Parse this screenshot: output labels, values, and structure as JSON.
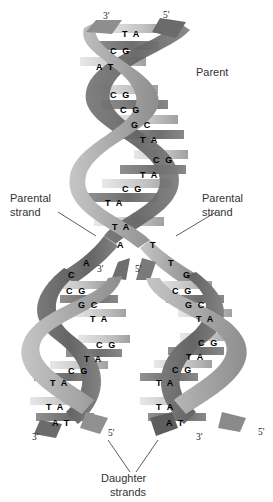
{
  "figure": {
    "background": "#ffffff",
    "ribbon_colors": {
      "light": "#b9b9b9",
      "mid": "#9a9a9a",
      "dark": "#6f6f6f",
      "darker": "#585858",
      "rung_light": "#d6d6d6",
      "rung_dark": "#7d7d7d",
      "rung_white": "#f4f4f4"
    }
  },
  "callouts": {
    "parent": "Parent",
    "parental_strand_left_line1": "Parental",
    "parental_strand_left_line2": "strand",
    "parental_strand_right_line1": "Parental",
    "parental_strand_right_line2": "strand",
    "daughter_line1": "Daughter",
    "daughter_line2": "strands"
  },
  "end_labels": {
    "parent_top_left": "3'",
    "parent_top_right": "5'",
    "fork_left": "3'",
    "fork_right": "5'",
    "daughter_left_left": "3'",
    "daughter_left_right": "5'",
    "daughter_right_left": "3'",
    "daughter_right_right": "5'"
  },
  "base_pairs": {
    "parent": [
      {
        "text": "T A",
        "x": 122,
        "y": 29
      },
      {
        "text": "C G",
        "x": 110,
        "y": 46
      },
      {
        "text": "A T",
        "x": 96,
        "y": 62
      },
      {
        "text": "C G",
        "x": 110,
        "y": 90
      },
      {
        "text": "C G",
        "x": 120,
        "y": 105
      },
      {
        "text": "G C",
        "x": 131,
        "y": 120
      },
      {
        "text": "T A",
        "x": 140,
        "y": 135
      },
      {
        "text": "C G",
        "x": 153,
        "y": 155
      },
      {
        "text": "T A",
        "x": 140,
        "y": 170
      },
      {
        "text": "C G",
        "x": 122,
        "y": 184
      },
      {
        "text": "T A",
        "x": 105,
        "y": 198
      },
      {
        "text": "T A",
        "x": 112,
        "y": 222
      }
    ],
    "fork_unpaired_left": [
      {
        "text": "A",
        "x": 117,
        "y": 240
      },
      {
        "text": "A",
        "x": 83,
        "y": 258
      },
      {
        "text": "C",
        "x": 68,
        "y": 270
      }
    ],
    "fork_unpaired_right": [
      {
        "text": "T",
        "x": 150,
        "y": 240
      },
      {
        "text": "T",
        "x": 168,
        "y": 258
      },
      {
        "text": "G",
        "x": 183,
        "y": 270
      }
    ],
    "daughter_left": [
      {
        "text": "C G",
        "x": 66,
        "y": 286
      },
      {
        "text": "G C",
        "x": 78,
        "y": 300
      },
      {
        "text": "T A",
        "x": 90,
        "y": 314
      },
      {
        "text": "C G",
        "x": 96,
        "y": 340
      },
      {
        "text": "T A",
        "x": 84,
        "y": 354
      },
      {
        "text": "C G",
        "x": 68,
        "y": 366
      },
      {
        "text": "T A",
        "x": 50,
        "y": 378
      },
      {
        "text": "T A",
        "x": 46,
        "y": 402
      },
      {
        "text": "A T",
        "x": 52,
        "y": 418
      }
    ],
    "daughter_right": [
      {
        "text": "C G",
        "x": 172,
        "y": 286
      },
      {
        "text": "G C",
        "x": 185,
        "y": 300
      },
      {
        "text": "T A",
        "x": 196,
        "y": 314
      },
      {
        "text": "C G",
        "x": 198,
        "y": 338
      },
      {
        "text": "T A",
        "x": 186,
        "y": 352
      },
      {
        "text": "C G",
        "x": 172,
        "y": 365
      },
      {
        "text": "T A",
        "x": 156,
        "y": 378
      },
      {
        "text": "T A",
        "x": 156,
        "y": 402
      },
      {
        "text": "A T",
        "x": 166,
        "y": 418
      }
    ]
  }
}
